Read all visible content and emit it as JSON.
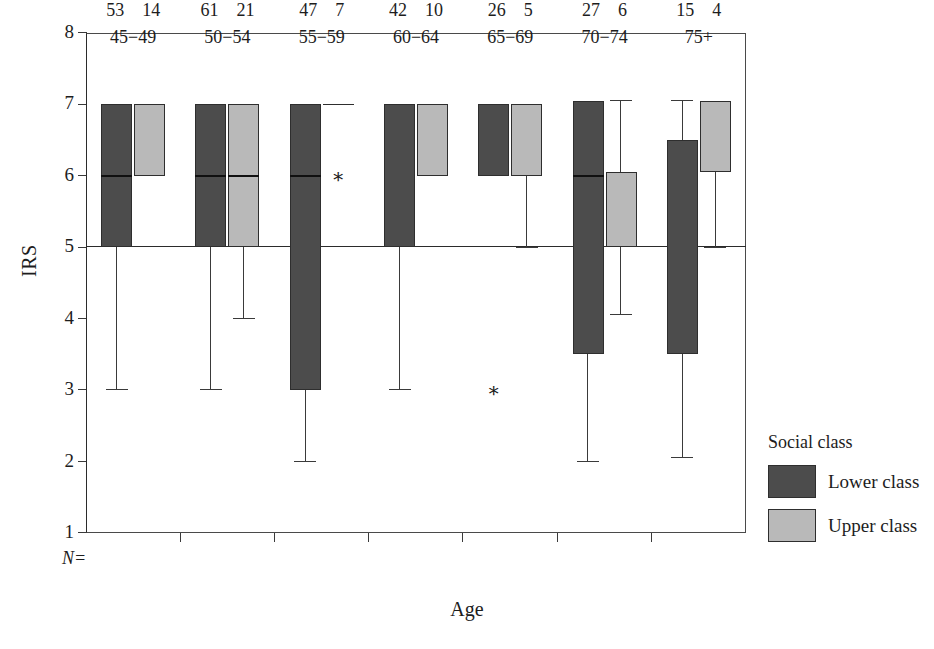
{
  "chart_data": {
    "type": "box",
    "title": "",
    "xlabel": "Age",
    "ylabel": "IRS",
    "ylim": [
      1,
      8
    ],
    "yticks": [
      8,
      7,
      6,
      5,
      4,
      3,
      2,
      1
    ],
    "grid": false,
    "reference_line": 5,
    "legend": {
      "title": "Social class",
      "position": "right",
      "entries": [
        {
          "name": "Lower class",
          "color": "#4c4c4c"
        },
        {
          "name": "Upper class",
          "color": "#b9b9b9"
        }
      ]
    },
    "n_prefix": "N=",
    "categories": [
      "45−49",
      "50−54",
      "55−59",
      "60−64",
      "65−69",
      "70−74",
      "75+"
    ],
    "groups": [
      {
        "age": "45−49",
        "n_lower": "53",
        "n_upper": "14",
        "lower": {
          "q1": 5.0,
          "median": 6.0,
          "q3": 7.0,
          "whisker_low": 3.0,
          "whisker_high": 7.0,
          "outliers": []
        },
        "upper": {
          "q1": 6.0,
          "median": 7.0,
          "q3": 7.0,
          "whisker_low": 6.0,
          "whisker_high": 7.0,
          "outliers": []
        }
      },
      {
        "age": "50−54",
        "n_lower": "61",
        "n_upper": "21",
        "lower": {
          "q1": 5.0,
          "median": 6.0,
          "q3": 7.0,
          "whisker_low": 3.0,
          "whisker_high": 7.0,
          "outliers": []
        },
        "upper": {
          "q1": 5.0,
          "median": 6.0,
          "q3": 7.0,
          "whisker_low": 4.0,
          "whisker_high": 7.0,
          "outliers": []
        }
      },
      {
        "age": "55−59",
        "n_lower": "47",
        "n_upper": "7",
        "lower": {
          "q1": 3.0,
          "median": 6.0,
          "q3": 7.0,
          "whisker_low": 2.0,
          "whisker_high": 7.0,
          "outliers": []
        },
        "upper": {
          "q1": 7.0,
          "median": 7.0,
          "q3": 7.0,
          "whisker_low": 7.0,
          "whisker_high": 7.0,
          "outliers": [
            6.0
          ]
        }
      },
      {
        "age": "60−64",
        "n_lower": "42",
        "n_upper": "10",
        "lower": {
          "q1": 5.0,
          "median": 7.0,
          "q3": 7.0,
          "whisker_low": 3.0,
          "whisker_high": 7.0,
          "outliers": []
        },
        "upper": {
          "q1": 6.0,
          "median": 7.0,
          "q3": 7.0,
          "whisker_low": 6.0,
          "whisker_high": 7.0,
          "outliers": []
        }
      },
      {
        "age": "65−69",
        "n_lower": "26",
        "n_upper": "5",
        "lower": {
          "q1": 6.0,
          "median": 7.0,
          "q3": 7.0,
          "whisker_low": 6.0,
          "whisker_high": 7.0,
          "outliers": [
            3.0
          ]
        },
        "upper": {
          "q1": 6.0,
          "median": 7.0,
          "q3": 7.0,
          "whisker_low": 5.0,
          "whisker_high": 7.0,
          "outliers": []
        }
      },
      {
        "age": "70−74",
        "n_lower": "27",
        "n_upper": "6",
        "lower": {
          "q1": 3.5,
          "median": 6.0,
          "q3": 7.05,
          "whisker_low": 2.0,
          "whisker_high": 7.05,
          "outliers": []
        },
        "upper": {
          "q1": 5.0,
          "median": 6.05,
          "q3": 6.05,
          "whisker_low": 4.05,
          "whisker_high": 7.05,
          "outliers": []
        }
      },
      {
        "age": "75+",
        "n_lower": "15",
        "n_upper": "4",
        "lower": {
          "q1": 3.5,
          "median": 6.5,
          "q3": 6.5,
          "whisker_low": 2.05,
          "whisker_high": 7.05,
          "outliers": []
        },
        "upper": {
          "q1": 6.05,
          "median": 7.05,
          "q3": 7.05,
          "whisker_low": 5.0,
          "whisker_high": 7.05,
          "outliers": []
        }
      }
    ]
  },
  "axis": {
    "y_title": "IRS",
    "x_title": "Age",
    "y_tick_labels": [
      "8",
      "7",
      "6",
      "5",
      "4",
      "3",
      "2",
      "1"
    ]
  },
  "legend": {
    "title": "Social class",
    "lower_label": "Lower class",
    "upper_label": "Upper class"
  },
  "n_prefix": "N="
}
